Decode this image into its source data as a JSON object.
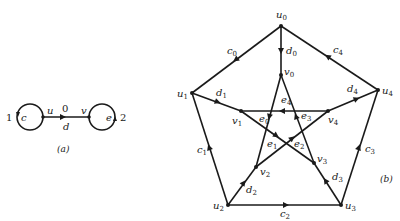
{
  "figure_a": {
    "caption": "(a)",
    "vertices": [
      {
        "id": "u",
        "label": "u",
        "x": 43,
        "y": 117
      },
      {
        "id": "v",
        "label": "v",
        "x": 89,
        "y": 117
      }
    ],
    "edges": [
      {
        "id": "c",
        "label": "c",
        "type": "loop",
        "at": "u",
        "number": "1"
      },
      {
        "id": "d",
        "label": "d",
        "from": "u",
        "to": "v",
        "number": "0"
      },
      {
        "id": "e",
        "label": "e",
        "type": "loop",
        "at": "v",
        "number": "2"
      }
    ]
  },
  "figure_b": {
    "caption": "(b)",
    "vertices": [
      {
        "id": "u0",
        "label": "u",
        "sub": "0",
        "x": 281,
        "y": 26
      },
      {
        "id": "u1",
        "label": "u",
        "sub": "1",
        "x": 192,
        "y": 93
      },
      {
        "id": "u2",
        "label": "u",
        "sub": "2",
        "x": 228,
        "y": 205
      },
      {
        "id": "u3",
        "label": "u",
        "sub": "3",
        "x": 341,
        "y": 205
      },
      {
        "id": "u4",
        "label": "u",
        "sub": "4",
        "x": 378,
        "y": 90
      },
      {
        "id": "v0",
        "label": "v",
        "sub": "0",
        "x": 281,
        "y": 75
      },
      {
        "id": "v1",
        "label": "v",
        "sub": "1",
        "x": 241,
        "y": 111
      },
      {
        "id": "v2",
        "label": "v",
        "sub": "2",
        "x": 256,
        "y": 167
      },
      {
        "id": "v3",
        "label": "v",
        "sub": "3",
        "x": 314,
        "y": 163
      },
      {
        "id": "v4",
        "label": "v",
        "sub": "4",
        "x": 328,
        "y": 111
      }
    ],
    "edges": [
      {
        "id": "c0",
        "label": "c",
        "sub": "0",
        "from": "u0",
        "to": "u1"
      },
      {
        "id": "c1",
        "label": "c",
        "sub": "1",
        "from": "u2",
        "to": "u1"
      },
      {
        "id": "c2",
        "label": "c",
        "sub": "2",
        "from": "u2",
        "to": "u3"
      },
      {
        "id": "c3",
        "label": "c",
        "sub": "3",
        "from": "u3",
        "to": "u4"
      },
      {
        "id": "c4",
        "label": "c",
        "sub": "4",
        "from": "u4",
        "to": "u0"
      },
      {
        "id": "d0",
        "label": "d",
        "sub": "0",
        "from": "u0",
        "to": "v0"
      },
      {
        "id": "d1",
        "label": "d",
        "sub": "1",
        "from": "u1",
        "to": "v1"
      },
      {
        "id": "d2",
        "label": "d",
        "sub": "2",
        "from": "u2",
        "to": "v2"
      },
      {
        "id": "d3",
        "label": "d",
        "sub": "3",
        "from": "u3",
        "to": "v3"
      },
      {
        "id": "d4",
        "label": "d",
        "sub": "4",
        "from": "v4",
        "to": "u4"
      },
      {
        "id": "e0",
        "label": "e",
        "sub": "0",
        "from": "v0",
        "to": "v2"
      },
      {
        "id": "e1",
        "label": "e",
        "sub": "1",
        "from": "v1",
        "to": "v3"
      },
      {
        "id": "e2",
        "label": "e",
        "sub": "2",
        "from": "v2",
        "to": "v4"
      },
      {
        "id": "e3",
        "label": "e",
        "sub": "3",
        "from": "v3",
        "to": "v0"
      },
      {
        "id": "e4",
        "label": "e",
        "sub": "4",
        "from": "v4",
        "to": "v1"
      }
    ]
  }
}
